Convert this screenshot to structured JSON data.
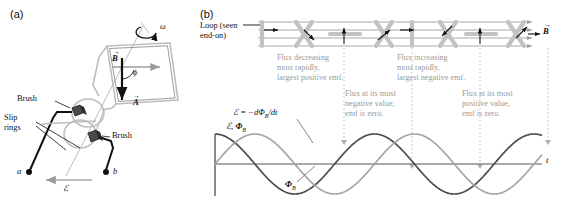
{
  "figure": {
    "panel_a_label": "(a)",
    "panel_b_label": "(b)"
  },
  "panel_a": {
    "labels": {
      "omega": "ω",
      "b_field": "B",
      "area_vector": "A",
      "phi": "ϕ",
      "brush_top": "Brush",
      "brush_bottom": "Brush",
      "slip_rings_line1": "Slip",
      "slip_rings_line2": "rings",
      "terminal_a": "a",
      "terminal_b": "b",
      "emf": "ℰ"
    }
  },
  "panel_b": {
    "loop_label_line1": "Loop (seen",
    "loop_label_line2": "end-on)",
    "b_field_label": "B",
    "annotations": [
      {
        "id": "flux-decreasing",
        "lines": [
          "Flux decreasing",
          "most rapidly,",
          "largest positive emf."
        ]
      },
      {
        "id": "flux-increasing",
        "lines": [
          "Flux increasing",
          "most rapidly,",
          "largest negative emf."
        ]
      },
      {
        "id": "flux-most-negative",
        "lines": [
          "Flux at its most",
          "negative value,",
          "emf is zero."
        ]
      },
      {
        "id": "flux-most-positive",
        "lines": [
          "Flux at its most",
          "positive value,",
          "emf is zero."
        ]
      }
    ],
    "equation": "ℰ = −dΦ",
    "equation_sub": "B",
    "equation_tail": "/dt",
    "axis_y_label_emf": "ℰ,",
    "axis_y_label_flux": "Φ",
    "axis_y_label_flux_sub": "B",
    "axis_x_label": "t",
    "curve_flux_label": "Φ",
    "curve_flux_label_sub": "B"
  },
  "chart_data": {
    "type": "line",
    "title": "",
    "xlabel": "t",
    "ylabel": "ℰ, Φ_B",
    "xlim": [
      0,
      2.05
    ],
    "ylim": [
      -1.15,
      1.15
    ],
    "grid": false,
    "legend": "inline-annotations",
    "x": [
      0,
      0.125,
      0.25,
      0.375,
      0.5,
      0.625,
      0.75,
      0.875,
      1.0,
      1.125,
      1.25,
      1.375,
      1.5,
      1.625,
      1.75,
      1.875,
      2.0
    ],
    "series": [
      {
        "name": "ℰ = -dΦ_B/dt",
        "color": "#4d4d4d",
        "function": "cos(2πx)",
        "values": [
          1.0,
          0.707,
          0.0,
          -0.707,
          -1.0,
          -0.707,
          0.0,
          0.707,
          1.0,
          0.707,
          0.0,
          -0.707,
          -1.0,
          -0.707,
          0.0,
          0.707,
          1.0
        ]
      },
      {
        "name": "Φ_B",
        "color": "#a6a6a6",
        "function": "sin(2πx)",
        "values": [
          0.0,
          0.707,
          1.0,
          0.707,
          0.0,
          -0.707,
          -1.0,
          -0.707,
          0.0,
          0.707,
          1.0,
          0.707,
          0.0,
          -0.707,
          -1.0,
          -0.707,
          0.0
        ]
      }
    ],
    "marked_instants": [
      {
        "x": 0.25,
        "note": "Flux decreasing most rapidly, largest positive emf."
      },
      {
        "x": 0.75,
        "note": "Flux at its most negative value, emf is zero."
      },
      {
        "x": 1.25,
        "note": "Flux increasing most rapidly, largest negative emf."
      },
      {
        "x": 1.75,
        "note": "Flux at its most positive value, emf is zero."
      }
    ]
  }
}
